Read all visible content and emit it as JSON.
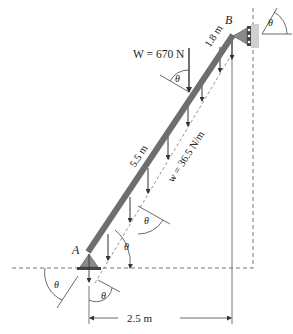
{
  "figure": {
    "points": {
      "A": "A",
      "B": "B"
    },
    "load": {
      "weight_label": "W = 670 N"
    },
    "dimensions": {
      "upper_segment": "1.8 m",
      "lower_segment": "5.5 m",
      "horizontal_span": "2.5 m"
    },
    "distributed_load": {
      "label": "w = 36.5 N/m"
    },
    "angle_symbol": "θ",
    "colors": {
      "beam": "#6e6e6e",
      "support": "#8a8a8a",
      "lines": "#444444",
      "dashed": "#666666"
    }
  }
}
